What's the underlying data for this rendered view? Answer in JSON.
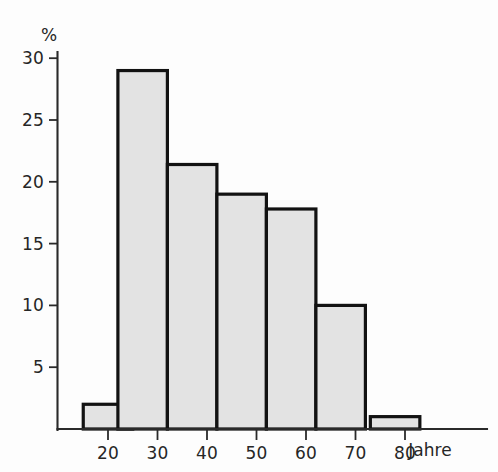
{
  "chart_data": {
    "type": "bar",
    "title": "",
    "subtitle": "",
    "xlabel": "Jahre",
    "ylabel": "%",
    "categories": [
      "10-20",
      "20-30",
      "30-40",
      "40-50",
      "50-60",
      "60-70",
      "70-80"
    ],
    "bins": [
      {
        "label": "10-20",
        "x_start": 15,
        "x_end": 20,
        "value": 2.0
      },
      {
        "label": "20-30",
        "x_start": 22,
        "x_end": 27,
        "value": 29.0
      },
      {
        "label": "30-40",
        "x_start": 32,
        "x_end": 37,
        "value": 21.4
      },
      {
        "label": "40-50",
        "x_start": 42,
        "x_end": 47,
        "value": 19.0
      },
      {
        "label": "50-60",
        "x_start": 52,
        "x_end": 57,
        "value": 17.8
      },
      {
        "label": "60-70",
        "x_start": 62,
        "x_end": 67,
        "value": 10.0
      },
      {
        "label": "70-80",
        "x_start": 73,
        "x_end": 78,
        "value": 1.0
      }
    ],
    "values": [
      2.0,
      29.0,
      21.4,
      19.0,
      17.8,
      10.0,
      1.0
    ],
    "x_ticks": [
      20,
      30,
      40,
      50,
      60,
      70,
      80
    ],
    "x_tick_labels": [
      "20",
      "30",
      "40",
      "50",
      "60",
      "70",
      "80"
    ],
    "y_ticks": [
      5,
      10,
      15,
      20,
      25,
      30
    ],
    "y_tick_labels": [
      "5",
      "10",
      "15",
      "20",
      "25",
      "30"
    ],
    "xlim": [
      10,
      85
    ],
    "ylim": [
      0,
      31
    ],
    "grid": false,
    "legend": false,
    "colors": {
      "bar_fill": "#e3e3e3",
      "bar_stroke": "#121212",
      "axis": "#2a2a2a",
      "text": "#262626",
      "background": "#fdfdfd"
    }
  }
}
